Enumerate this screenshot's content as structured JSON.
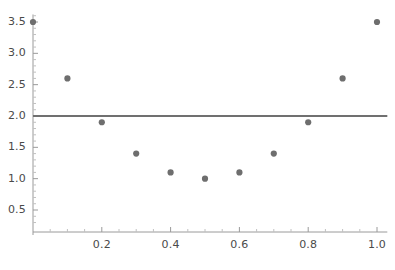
{
  "chart_data": {
    "type": "scatter",
    "title": "",
    "subtitle": "",
    "xlabel": "",
    "ylabel": "",
    "x": [
      0.0,
      0.1,
      0.2,
      0.3,
      0.4,
      0.5,
      0.6,
      0.7,
      0.8,
      0.9,
      1.0
    ],
    "values": [
      3.5,
      2.6,
      1.9,
      1.4,
      1.1,
      1.0,
      1.1,
      1.4,
      1.9,
      2.6,
      3.5
    ],
    "series": [
      {
        "name": "data-points",
        "marker": "circle",
        "color": "#6e6e6e",
        "values": [
          3.5,
          2.6,
          1.9,
          1.4,
          1.1,
          1.0,
          1.1,
          1.4,
          1.9,
          2.6,
          3.5
        ]
      }
    ],
    "reference_lines": [
      {
        "name": "horizontal-reference-line",
        "orientation": "horizontal",
        "y": 2.0,
        "x_start": 0.0,
        "x_end": 1.03,
        "color": "#707070"
      }
    ],
    "xlim": [
      -0.01,
      1.03
    ],
    "ylim": [
      0.18,
      3.62
    ],
    "xticks": [
      0.2,
      0.4,
      0.6,
      0.8,
      1.0
    ],
    "xtick_labels": [
      "0.2",
      "0.4",
      "0.6",
      "0.8",
      "1.0"
    ],
    "yticks": [
      0.5,
      1.0,
      1.5,
      2.0,
      2.5,
      3.0,
      3.5
    ],
    "ytick_labels": [
      "0.5",
      "1.0",
      "1.5",
      "2.0",
      "2.5",
      "3.0",
      "3.5"
    ],
    "x_minor_ticks": [
      0.05,
      0.1,
      0.15,
      0.25,
      0.3,
      0.35,
      0.45,
      0.5,
      0.55,
      0.65,
      0.7,
      0.75,
      0.85,
      0.9,
      0.95
    ],
    "y_minor_ticks": [
      0.3,
      0.4,
      0.6,
      0.7,
      0.8,
      0.9,
      1.1,
      1.2,
      1.3,
      1.4,
      1.6,
      1.7,
      1.8,
      1.9,
      2.1,
      2.2,
      2.3,
      2.4,
      2.6,
      2.7,
      2.8,
      2.9,
      3.1,
      3.2,
      3.3,
      3.4,
      3.6
    ],
    "grid": false,
    "legend": null,
    "legend_position": "none",
    "axis_color": "#9a9a9a",
    "tick_label_color": "#4a4a4a",
    "background_color": "#ffffff",
    "marker_radius": 3.1
  }
}
